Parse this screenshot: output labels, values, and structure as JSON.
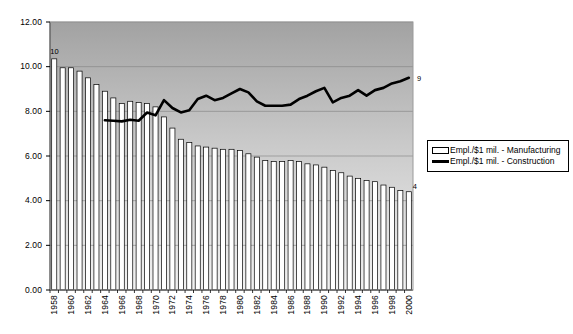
{
  "chart_data": {
    "type": "bar",
    "title": "",
    "subtitle": "",
    "xlabel": "",
    "ylabel": "",
    "ylim": [
      0,
      12
    ],
    "ytick_step": 2,
    "ytick_labels": [
      "0.00",
      "2.00",
      "4.00",
      "6.00",
      "8.00",
      "10.00",
      "12.00"
    ],
    "grid": true,
    "legend_position": "right",
    "xtick_labels": [
      "1958",
      "1960",
      "1962",
      "1964",
      "1966",
      "1968",
      "1970",
      "1972",
      "1974",
      "1976",
      "1978",
      "1980",
      "1982",
      "1984",
      "1986",
      "1988",
      "1990",
      "1992",
      "1994",
      "1996",
      "1998",
      "2000"
    ],
    "xtick_interval": 2,
    "categories": [
      "1958",
      "1959",
      "1960",
      "1961",
      "1962",
      "1963",
      "1964",
      "1965",
      "1966",
      "1967",
      "1968",
      "1969",
      "1970",
      "1971",
      "1972",
      "1973",
      "1974",
      "1975",
      "1976",
      "1977",
      "1978",
      "1979",
      "1980",
      "1981",
      "1982",
      "1983",
      "1984",
      "1985",
      "1986",
      "1987",
      "1988",
      "1989",
      "1990",
      "1991",
      "1992",
      "1993",
      "1994",
      "1995",
      "1996",
      "1997",
      "1998",
      "1999",
      "2000"
    ],
    "series": [
      {
        "name": "Empl./$1 mil. - Manufacturing",
        "type": "bar",
        "color": "#ffffff",
        "edge_color": "#000000",
        "values": [
          10.35,
          9.95,
          9.95,
          9.8,
          9.5,
          9.2,
          8.9,
          8.6,
          8.35,
          8.45,
          8.4,
          8.35,
          8.2,
          7.75,
          7.25,
          6.75,
          6.6,
          6.45,
          6.4,
          6.35,
          6.3,
          6.3,
          6.25,
          6.1,
          5.95,
          5.8,
          5.75,
          5.75,
          5.8,
          5.75,
          5.65,
          5.6,
          5.5,
          5.35,
          5.25,
          5.1,
          5.0,
          4.9,
          4.85,
          4.7,
          4.6,
          4.45,
          4.4
        ],
        "data_labels": [
          {
            "category": "1958",
            "text": "10"
          },
          {
            "category": "2000",
            "text": "4"
          }
        ]
      },
      {
        "name": "Empl./$1 mil. - Construction",
        "type": "line",
        "color": "#000000",
        "start_category": "1964",
        "values": [
          null,
          null,
          null,
          null,
          null,
          null,
          7.6,
          7.58,
          7.55,
          7.62,
          7.58,
          7.95,
          7.82,
          8.5,
          8.15,
          7.95,
          8.05,
          8.55,
          8.7,
          8.5,
          8.6,
          8.8,
          9.0,
          8.85,
          8.45,
          8.25,
          8.25,
          8.25,
          8.3,
          8.55,
          8.7,
          8.9,
          9.05,
          8.4,
          8.6,
          8.7,
          8.95,
          8.7,
          8.95,
          9.05,
          9.25,
          9.35,
          9.5
        ],
        "data_labels": [
          {
            "category": "2000",
            "text": "9"
          }
        ]
      }
    ]
  },
  "legend": {
    "items": [
      {
        "label": "Empl./$1 mil. - Manufacturing",
        "marker": "bar-swatch"
      },
      {
        "label": "Empl./$1 mil. - Construction",
        "marker": "line-swatch"
      }
    ]
  },
  "style": {
    "plot_bg_top": "#a8a8a8",
    "plot_bg_bottom": "#f0f0f0",
    "grid_color": "#808080",
    "axis_color": "#000000",
    "bar_fill": "#ffffff",
    "line_color": "#000000"
  }
}
